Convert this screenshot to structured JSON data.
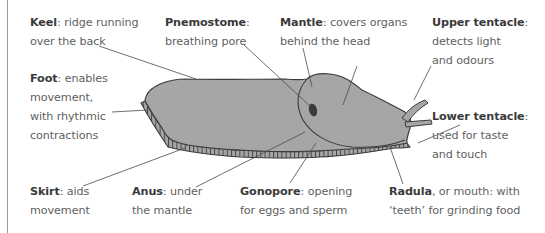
{
  "diagram": {
    "colors": {
      "body_fill": "#a6a6a6",
      "outline": "#3c3c3c",
      "pneumostome": "#3a3a3a",
      "leader_line": "#4a4a4a",
      "text": "#5f5f5f",
      "term": "#3a3a3a",
      "frame_line": "#9a9a9a"
    },
    "labels": [
      {
        "id": "keel",
        "term": "Keel",
        "rest": ": ridge running",
        "line2": "over the back",
        "line3": ""
      },
      {
        "id": "pnemostome",
        "term": "Pnemostome",
        "rest": ":",
        "line2": "breathing pore",
        "line3": ""
      },
      {
        "id": "mantle",
        "term": "Mantle",
        "rest": ": covers organs",
        "line2": "behind the head",
        "line3": ""
      },
      {
        "id": "upper-tentacle",
        "term": "Upper tentacle",
        "rest": ":",
        "line2": "detects light",
        "line3": "and odours"
      },
      {
        "id": "foot",
        "term": "Foot",
        "rest": ": enables",
        "line2": "movement,",
        "line3": "with rhythmic",
        "line4": "contractions"
      },
      {
        "id": "lower-tentacle",
        "term": "Lower tentacle",
        "rest": ":",
        "line2": "used for taste",
        "line3": "and touch"
      },
      {
        "id": "skirt",
        "term": "Skirt",
        "rest": ": aids",
        "line2": "movement",
        "line3": ""
      },
      {
        "id": "anus",
        "term": "Anus",
        "rest": ": under",
        "line2": "the mantle",
        "line3": ""
      },
      {
        "id": "gonopore",
        "term": "Gonopore",
        "rest": ": opening",
        "line2": "for eggs and sperm",
        "line3": ""
      },
      {
        "id": "radula",
        "term": "Radula",
        "rest": ", or mouth: with",
        "line2": "‘teeth’ for grinding food",
        "line3": ""
      }
    ]
  }
}
